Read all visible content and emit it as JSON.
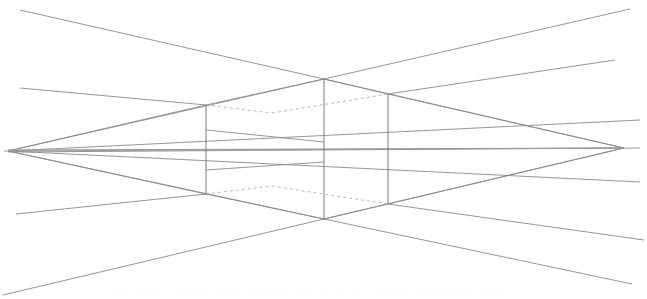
{
  "diagram": {
    "canvas": {
      "width": 647,
      "height": 299,
      "background": "#ffffff"
    },
    "colors": {
      "line": "#8a8a8a",
      "horizon": "#9a9a9a",
      "vertical": "#7a7a7a",
      "hidden": "#a5a5a5"
    },
    "vanishing_points": {
      "left": {
        "x": 8,
        "y": 151
      },
      "right": {
        "x": 624,
        "y": 148
      }
    },
    "horizon_line": {
      "x1": 4,
      "y1": 151,
      "x2": 640,
      "y2": 148
    },
    "box": {
      "front_edge": {
        "x": 324,
        "top": 79,
        "bottom": 219
      },
      "left_edge": {
        "x": 206,
        "top": 105,
        "bottom": 194
      },
      "right_edge": {
        "x": 388,
        "top": 94,
        "bottom": 204
      }
    },
    "construction_lines": [
      {
        "name": "upper-left-ray",
        "x1": 20,
        "y1": 10,
        "x2": 324,
        "y2": 79
      },
      {
        "name": "upper-right-ray",
        "x1": 324,
        "y1": 79,
        "x2": 630,
        "y2": 9
      },
      {
        "name": "top-left-long",
        "x1": 20,
        "y1": 88,
        "x2": 206,
        "y2": 105
      },
      {
        "name": "top-right-long",
        "x1": 388,
        "y1": 94,
        "x2": 615,
        "y2": 60
      },
      {
        "name": "lower-left-long",
        "x1": 16,
        "y1": 214,
        "x2": 206,
        "y2": 194
      },
      {
        "name": "lower-right-long",
        "x1": 388,
        "y1": 204,
        "x2": 644,
        "y2": 240
      },
      {
        "name": "bottom-left-ray",
        "x1": 3,
        "y1": 295,
        "x2": 324,
        "y2": 219
      },
      {
        "name": "bottom-right-ray",
        "x1": 324,
        "y1": 219,
        "x2": 632,
        "y2": 284
      }
    ],
    "caption": "···· ··· ··· ······ ····· ·· ····· ···· ···· ····· ·· ··· ········ ··· ····"
  }
}
